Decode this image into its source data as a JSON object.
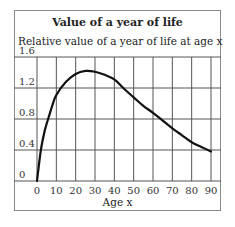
{
  "chart_data": {
    "type": "line",
    "title": "Value of a year of life",
    "ylabel": "Relative value of a year of  life at age x",
    "xlabel": "Age x",
    "xlim": [
      0,
      90
    ],
    "ylim": [
      0,
      1.6
    ],
    "x_ticks": [
      0,
      10,
      20,
      30,
      40,
      50,
      60,
      70,
      80,
      90
    ],
    "y_ticks": [
      0,
      0.4,
      0.8,
      1.2,
      1.6
    ],
    "y_tick_labels": [
      "0",
      "0.4",
      "0.8",
      "1.2",
      "1.6"
    ],
    "grid": true,
    "legend": null,
    "series": [
      {
        "name": "Relative value",
        "x": [
          0,
          2,
          4,
          6,
          8,
          10,
          15,
          20,
          25,
          30,
          35,
          40,
          45,
          50,
          55,
          60,
          65,
          70,
          75,
          80,
          85,
          90
        ],
        "values": [
          0,
          0.4,
          0.65,
          0.82,
          0.98,
          1.11,
          1.28,
          1.38,
          1.42,
          1.41,
          1.37,
          1.31,
          1.19,
          1.08,
          0.97,
          0.88,
          0.78,
          0.68,
          0.59,
          0.5,
          0.44,
          0.38
        ]
      }
    ]
  }
}
